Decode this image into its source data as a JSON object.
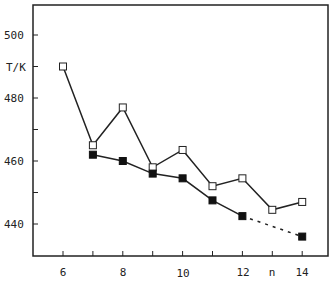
{
  "chart_data": {
    "type": "line",
    "title": "",
    "xlabel": "n",
    "ylabel": "T/K",
    "xlim": [
      5,
      15
    ],
    "ylim": [
      430,
      510
    ],
    "x_ticks": [
      6,
      8,
      10,
      12,
      14
    ],
    "y_ticks": [
      440,
      460,
      480,
      500
    ],
    "grid": false,
    "legend": null,
    "series": [
      {
        "name": "open squares",
        "marker": "open-square",
        "line": "solid",
        "x": [
          6,
          7,
          8,
          9,
          10,
          11,
          12,
          13,
          14
        ],
        "values": [
          490,
          465,
          477,
          458,
          463.5,
          452,
          454.5,
          444.5,
          447
        ]
      },
      {
        "name": "filled squares",
        "marker": "filled-square",
        "line": "solid (dashed from 12 to 14)",
        "x": [
          7,
          8,
          9,
          10,
          11,
          12,
          14
        ],
        "values": [
          462,
          460,
          456,
          454.5,
          447.5,
          442.5,
          436
        ]
      }
    ]
  },
  "axes": {
    "y_label": "T/K",
    "x_label": "n",
    "y_tick_labels": [
      "500",
      "480",
      "460",
      "440"
    ],
    "x_tick_labels": [
      "6",
      "8",
      "10",
      "12",
      "14"
    ]
  }
}
